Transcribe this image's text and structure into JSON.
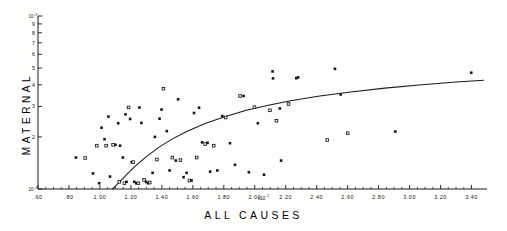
{
  "figure": {
    "background_color": "#fdfdfc",
    "ink_color": "#171717"
  },
  "chart_data": {
    "type": "scatter",
    "title": "",
    "subtitle": "",
    "xlabel": "ALL CAUSES",
    "ylabel": "MATERNAL",
    "x_multiplier_label": "x10",
    "x_multiplier_exponent": "-2",
    "x_scale": "linear",
    "y_scale": "log",
    "xlim": [
      0.6,
      3.5
    ],
    "ylim": [
      0.0001,
      0.001
    ],
    "grid": false,
    "legend": "none",
    "xticks": [
      0.6,
      0.8,
      1.0,
      1.2,
      1.4,
      1.6,
      1.8,
      2.0,
      2.2,
      2.4,
      2.6,
      2.8,
      3.0,
      3.2,
      3.4
    ],
    "xticklabels": [
      ".60",
      ".80",
      "1.00",
      "1.20",
      "1.40",
      "1.60",
      "1.80",
      "2.00",
      "2.20",
      "2.40",
      "2.60",
      "2.80",
      "3.00",
      "3.20",
      "3.40"
    ],
    "yticks": [
      0.0001,
      0.0002,
      0.0003,
      0.0004,
      0.0005,
      0.0006,
      0.0007,
      0.0008,
      0.0009,
      0.001
    ],
    "yticklabels": [
      "10",
      "2",
      "3",
      "4",
      "5",
      "6",
      "7",
      "8",
      "9",
      "10"
    ],
    "y_top_label": "10",
    "y_top_exponent": "-3",
    "y_bottom_label": "10",
    "y_bottom_exponent": "-4",
    "y_minor_labels": [
      "9",
      "8",
      "7",
      "6",
      "5",
      "4",
      "3",
      "2"
    ],
    "marker_style": "small-square",
    "points": [
      {
        "x": 0.845,
        "y": 0.000152
      },
      {
        "x": 0.905,
        "y": 0.000151
      },
      {
        "x": 0.955,
        "y": 0.000123
      },
      {
        "x": 0.995,
        "y": 0.000108
      },
      {
        "x": 0.98,
        "y": 0.000178
      },
      {
        "x": 1.01,
        "y": 0.000226
      },
      {
        "x": 1.03,
        "y": 0.000194
      },
      {
        "x": 1.04,
        "y": 0.000178
      },
      {
        "x": 1.055,
        "y": 0.000262
      },
      {
        "x": 1.065,
        "y": 0.000118
      },
      {
        "x": 1.085,
        "y": 0.00018
      },
      {
        "x": 1.1,
        "y": 0.00018
      },
      {
        "x": 1.118,
        "y": 0.00024
      },
      {
        "x": 1.125,
        "y": 0.00011
      },
      {
        "x": 1.13,
        "y": 0.000178
      },
      {
        "x": 1.148,
        "y": 0.000152
      },
      {
        "x": 1.158,
        "y": 0.000108
      },
      {
        "x": 1.165,
        "y": 0.00027
      },
      {
        "x": 1.172,
        "y": 0.00011
      },
      {
        "x": 1.185,
        "y": 0.000296
      },
      {
        "x": 1.195,
        "y": 0.000254
      },
      {
        "x": 1.205,
        "y": 0.000143
      },
      {
        "x": 1.215,
        "y": 0.000143
      },
      {
        "x": 1.222,
        "y": 0.00011
      },
      {
        "x": 1.235,
        "y": 0.000108
      },
      {
        "x": 1.248,
        "y": 0.000108
      },
      {
        "x": 1.255,
        "y": 0.000296
      },
      {
        "x": 1.268,
        "y": 0.000241
      },
      {
        "x": 1.285,
        "y": 0.000113
      },
      {
        "x": 1.298,
        "y": 0.00011
      },
      {
        "x": 1.31,
        "y": 0.000108
      },
      {
        "x": 1.322,
        "y": 0.000109
      },
      {
        "x": 1.34,
        "y": 0.000124
      },
      {
        "x": 1.355,
        "y": 0.0002
      },
      {
        "x": 1.368,
        "y": 0.000148
      },
      {
        "x": 1.385,
        "y": 0.000255
      },
      {
        "x": 1.398,
        "y": 0.000288
      },
      {
        "x": 1.41,
        "y": 0.00038
      },
      {
        "x": 1.432,
        "y": 0.000216
      },
      {
        "x": 1.45,
        "y": 0.000128
      },
      {
        "x": 1.468,
        "y": 0.000152
      },
      {
        "x": 1.49,
        "y": 0.000146
      },
      {
        "x": 1.505,
        "y": 0.00033
      },
      {
        "x": 1.52,
        "y": 0.000147
      },
      {
        "x": 1.54,
        "y": 0.000117
      },
      {
        "x": 1.56,
        "y": 0.000124
      },
      {
        "x": 1.578,
        "y": 0.000112
      },
      {
        "x": 1.592,
        "y": 0.000112
      },
      {
        "x": 1.608,
        "y": 0.000275
      },
      {
        "x": 1.625,
        "y": 0.000152
      },
      {
        "x": 1.64,
        "y": 0.000295
      },
      {
        "x": 1.66,
        "y": 0.000186
      },
      {
        "x": 1.68,
        "y": 0.000182
      },
      {
        "x": 1.695,
        "y": 0.000185
      },
      {
        "x": 1.712,
        "y": 0.000126
      },
      {
        "x": 1.735,
        "y": 0.000178
      },
      {
        "x": 1.758,
        "y": 0.000128
      },
      {
        "x": 1.79,
        "y": 0.000264
      },
      {
        "x": 1.812,
        "y": 0.000259
      },
      {
        "x": 1.84,
        "y": 0.000184
      },
      {
        "x": 1.872,
        "y": 0.000138
      },
      {
        "x": 1.905,
        "y": 0.000345
      },
      {
        "x": 1.928,
        "y": 0.000345
      },
      {
        "x": 1.962,
        "y": 0.000125
      },
      {
        "x": 1.998,
        "y": 0.000297
      },
      {
        "x": 2.02,
        "y": 0.00024
      },
      {
        "x": 2.06,
        "y": 0.000121
      },
      {
        "x": 2.098,
        "y": 0.000285
      },
      {
        "x": 2.115,
        "y": 0.000478
      },
      {
        "x": 2.118,
        "y": 0.000436
      },
      {
        "x": 2.14,
        "y": 0.000248
      },
      {
        "x": 2.162,
        "y": 0.000292
      },
      {
        "x": 2.17,
        "y": 0.000146
      },
      {
        "x": 2.218,
        "y": 0.00031
      },
      {
        "x": 2.268,
        "y": 0.000437
      },
      {
        "x": 2.28,
        "y": 0.000442
      },
      {
        "x": 2.468,
        "y": 0.000192
      },
      {
        "x": 2.518,
        "y": 0.000495
      },
      {
        "x": 2.555,
        "y": 0.000352
      },
      {
        "x": 2.6,
        "y": 0.00021
      },
      {
        "x": 2.908,
        "y": 0.000215
      },
      {
        "x": 3.398,
        "y": 0.00047
      }
    ],
    "fit_curve": {
      "name": "fitted-regression-curve",
      "description": "monotone increasing saturating fit through scatter",
      "points": [
        {
          "x": 1.08,
          "y": 0.0001
        },
        {
          "x": 1.11,
          "y": 0.000106
        },
        {
          "x": 1.14,
          "y": 0.000113
        },
        {
          "x": 1.18,
          "y": 0.000123
        },
        {
          "x": 1.23,
          "y": 0.000136
        },
        {
          "x": 1.3,
          "y": 0.000154
        },
        {
          "x": 1.38,
          "y": 0.000174
        },
        {
          "x": 1.46,
          "y": 0.000193
        },
        {
          "x": 1.56,
          "y": 0.000215
        },
        {
          "x": 1.68,
          "y": 0.000239
        },
        {
          "x": 1.8,
          "y": 0.000261
        },
        {
          "x": 1.94,
          "y": 0.000284
        },
        {
          "x": 2.08,
          "y": 0.000304
        },
        {
          "x": 2.24,
          "y": 0.000325
        },
        {
          "x": 2.42,
          "y": 0.000345
        },
        {
          "x": 2.62,
          "y": 0.000364
        },
        {
          "x": 2.84,
          "y": 0.000383
        },
        {
          "x": 3.08,
          "y": 0.000401
        },
        {
          "x": 3.3,
          "y": 0.000415
        },
        {
          "x": 3.48,
          "y": 0.000425
        }
      ]
    }
  }
}
